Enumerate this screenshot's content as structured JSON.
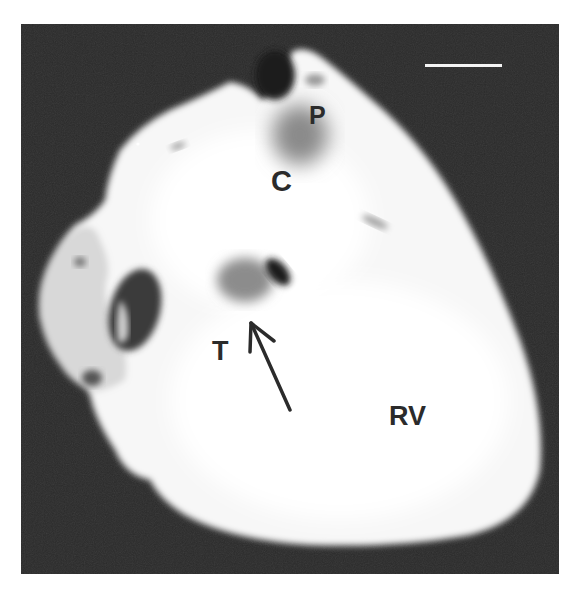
{
  "figure": {
    "background_color": "#2a2a2a",
    "tissue_color": "#fafafa",
    "scale_bar": {
      "color": "#f4f4f4",
      "x1": 425,
      "x2": 502,
      "y": 65
    },
    "labels": [
      {
        "id": "P",
        "text": "P",
        "x": 309,
        "y": 104,
        "size": 24
      },
      {
        "id": "C",
        "text": "C",
        "x": 272,
        "y": 168,
        "size": 28
      },
      {
        "id": "T",
        "text": "T",
        "x": 213,
        "y": 339,
        "size": 26
      },
      {
        "id": "RV",
        "text": "RV",
        "x": 389,
        "y": 404,
        "size": 26
      }
    ],
    "arrow": {
      "tail": [
        290,
        410
      ],
      "head": [
        251,
        323
      ],
      "color": "#2b2b2b"
    }
  }
}
